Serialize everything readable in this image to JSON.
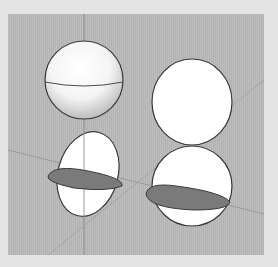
{
  "viewport": {
    "background": "#b9b9b9",
    "frame": "#e4e4e4",
    "axis_color": "#8a8a8a"
  },
  "objects": [
    {
      "id": "shaded-sphere",
      "label": "Sphere with equator",
      "state": "shaded"
    },
    {
      "id": "flat-circle",
      "label": "Flat circle face",
      "state": "unshaded"
    },
    {
      "id": "split-sphere-left",
      "label": "Sphere with section plane",
      "state": "sectioned"
    },
    {
      "id": "split-sphere-right",
      "label": "Sphere with section plane",
      "state": "sectioned"
    }
  ],
  "colors": {
    "outline": "#3a3a3a",
    "face": "#ffffff",
    "section": "#7a7a7a"
  }
}
